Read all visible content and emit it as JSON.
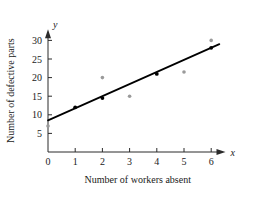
{
  "chart_data": {
    "type": "scatter",
    "title": "",
    "xlabel": "Number of workers absent",
    "ylabel": "Number of defective parts",
    "x_axis_symbol": "x",
    "y_axis_symbol": "y",
    "xlim": [
      0,
      6.6
    ],
    "ylim": [
      0,
      33
    ],
    "xticks": [
      0,
      1,
      2,
      3,
      4,
      5,
      6
    ],
    "xtick_labels": [
      "0",
      "1",
      "2",
      "3",
      "4",
      "5",
      "6"
    ],
    "yticks": [
      5,
      10,
      15,
      20,
      25,
      30
    ],
    "ytick_labels": [
      "5",
      "10",
      "15",
      "20",
      "25",
      "30"
    ],
    "grid": false,
    "legend": "none",
    "series": [
      {
        "name": "points-on-line",
        "marker": "dot",
        "color": "#000000",
        "points": [
          {
            "x": 1,
            "y": 12
          },
          {
            "x": 2,
            "y": 14.5
          },
          {
            "x": 4,
            "y": 21
          },
          {
            "x": 6,
            "y": 28
          }
        ]
      },
      {
        "name": "scatter-points",
        "marker": "dot",
        "color": "#9a9a9a",
        "points": [
          {
            "x": 0,
            "y": 7
          },
          {
            "x": 2,
            "y": 20
          },
          {
            "x": 3,
            "y": 15
          },
          {
            "x": 5,
            "y": 21.5
          },
          {
            "x": 6,
            "y": 30
          }
        ]
      }
    ],
    "trendline": {
      "name": "regression-line",
      "color": "#000000",
      "x_start": 0,
      "y_start": 8.5,
      "x_end": 6.3,
      "y_end": 29
    }
  }
}
